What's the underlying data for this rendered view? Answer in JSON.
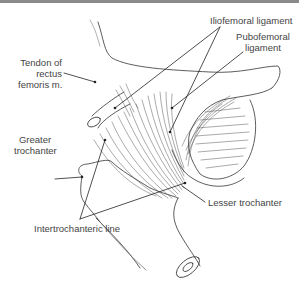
{
  "figure": {
    "labels": {
      "tendon_rectus": [
        "Tendon of",
        "rectus",
        "femoris m."
      ],
      "iliofemoral": "Iliofemoral ligament",
      "pubofemoral": [
        "Pubofemoral",
        "ligament"
      ],
      "greater_trochanter": [
        "Greater",
        "trochanter"
      ],
      "lesser_trochanter": "Lesser trochanter",
      "intertrochanteric": "Intertrochanteric line"
    },
    "colors": {
      "line": "#333333",
      "text": "#444444",
      "border": "#8a8a8a"
    }
  }
}
